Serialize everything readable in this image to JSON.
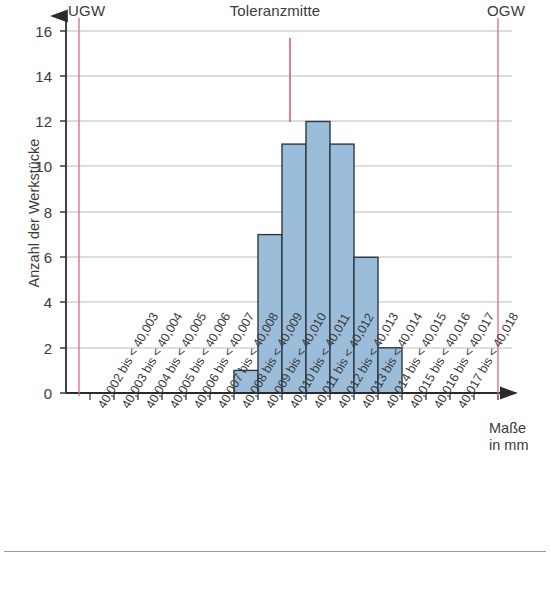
{
  "chart_data": {
    "type": "bar",
    "title": "Toleranzmitte",
    "xlabel": "Maße in mm",
    "ylabel": "Anzahl der Werkstücke",
    "ylim": [
      0,
      16
    ],
    "yticks": [
      0,
      2,
      4,
      6,
      8,
      10,
      12,
      14,
      16
    ],
    "grid": true,
    "legend": "none",
    "categories": [
      "40,002 bis < 40,003",
      "40,003 bis < 40,004",
      "40,004 bis < 40,005",
      "40,005 bis < 40,006",
      "40,006 bis < 40,007",
      "40,007 bis < 40,008",
      "40,008 bis < 40,009",
      "40,009 bis < 40,010",
      "40,010 bis < 40,011",
      "40,011 bis < 40,012",
      "40,012 bis < 40,013",
      "40,013 bis < 40,014",
      "40,014 bis < 40,015",
      "40,015 bis < 40,016",
      "40,016 bis < 40,017",
      "40,017 bis < 40,018"
    ],
    "values": [
      0,
      0,
      0,
      0,
      0,
      0,
      1,
      7,
      11,
      12,
      11,
      6,
      2,
      0,
      0,
      0
    ],
    "bar_fill": "#9cbdd9",
    "bar_stroke": "#2b3a4a",
    "annotations": [
      {
        "name": "UGW",
        "label": "UGW",
        "position_bin": 0,
        "color": "#e0607e"
      },
      {
        "name": "Toleranzmitte",
        "label": "Toleranzmitte",
        "position_bin": 8.35,
        "color": "#cf5f72"
      },
      {
        "name": "OGW",
        "label": "OGW",
        "position_bin": 17,
        "color": "#e0607e"
      }
    ]
  },
  "axis": {
    "xlabel_line1": "Maße",
    "xlabel_line2": "in mm"
  }
}
